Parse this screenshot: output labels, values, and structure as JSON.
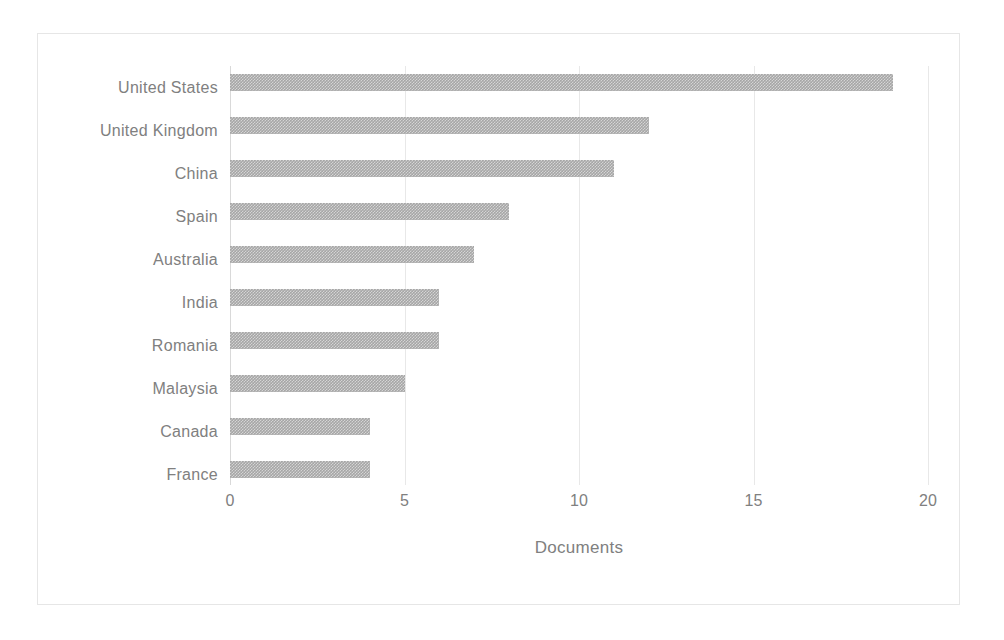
{
  "chart_data": {
    "type": "bar",
    "orientation": "horizontal",
    "title": "",
    "subtitle": "",
    "xlabel": "Documents",
    "ylabel": "",
    "categories": [
      "United States",
      "United Kingdom",
      "China",
      "Spain",
      "Australia",
      "India",
      "Romania",
      "Malaysia",
      "Canada",
      "France"
    ],
    "values": [
      19,
      12,
      11,
      8,
      7,
      6,
      6,
      5,
      4,
      4
    ],
    "xlim": [
      0,
      20
    ],
    "xticks": [
      0,
      5,
      10,
      15,
      20
    ],
    "xtick_labels": [
      "0",
      "5",
      "10",
      "15",
      "20"
    ],
    "grid": true,
    "grid_axis": "x",
    "legend": false,
    "legend_position": "none",
    "bar_color": "#a6a6a6",
    "gridline_color": "#e8e8e8",
    "text_color": "#808080",
    "frame_color": "#e6e6e6",
    "background_color": "#ffffff"
  }
}
